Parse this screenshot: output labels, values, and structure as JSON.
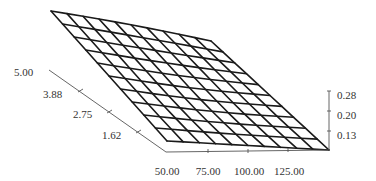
{
  "chart_data": {
    "type": "surface",
    "title": "",
    "xlabel": "",
    "ylabel": "",
    "zlabel": "",
    "x_axis": {
      "ticks": [
        50.0,
        75.0,
        100.0,
        125.0
      ],
      "tick_labels": [
        "50.00",
        "75.00",
        "100.00",
        "125.00"
      ],
      "range": [
        50,
        150
      ]
    },
    "y_axis": {
      "ticks": [
        1.62,
        2.75,
        3.88,
        5.0
      ],
      "tick_labels": [
        "1.62",
        "2.75",
        "3.88",
        "5.00"
      ],
      "range": [
        0.5,
        5.0
      ]
    },
    "z_axis": {
      "ticks": [
        0.13,
        0.2,
        0.28
      ],
      "tick_labels": [
        "0.13",
        "0.20",
        "0.28"
      ],
      "range": [
        0.05,
        0.28
      ]
    },
    "grid": {
      "rows": 10,
      "cols": 10,
      "description": "Wireframe surface, 11x11 vertices; surface rises toward low x / high y corner (back-left) and descends toward high x / low y corner (front-right)."
    },
    "projected_corners": {
      "top_left": [
        51,
        11
      ],
      "top_right": [
        211,
        41
      ],
      "bottom_left": [
        167,
        141
      ],
      "bottom_right": [
        329,
        150
      ]
    }
  },
  "axes": {
    "y_labels": [
      {
        "text": "5.00",
        "x": 14,
        "y": 76
      },
      {
        "text": "3.88",
        "x": 43,
        "y": 98
      },
      {
        "text": "2.75",
        "x": 73,
        "y": 118
      },
      {
        "text": "1.62",
        "x": 102,
        "y": 139
      }
    ],
    "x_labels": [
      {
        "text": "50.00",
        "x": 167,
        "y": 175
      },
      {
        "text": "75.00",
        "x": 208,
        "y": 175
      },
      {
        "text": "100.00",
        "x": 249,
        "y": 175
      },
      {
        "text": "125.00",
        "x": 289,
        "y": 175
      }
    ],
    "z_labels": [
      {
        "text": "0.28",
        "x": 337,
        "y": 99
      },
      {
        "text": "0.20",
        "x": 337,
        "y": 119
      },
      {
        "text": "0.13",
        "x": 337,
        "y": 139
      }
    ]
  }
}
